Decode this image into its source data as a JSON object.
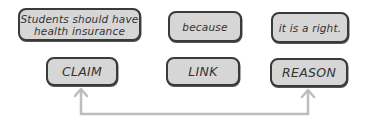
{
  "top_row": {
    "claim_text": "Students should have health insurance",
    "claim_line1": "Students should have",
    "claim_line2": "health insurance",
    "link_text": "because",
    "reason_text": "it is a right."
  },
  "bottom_row": {
    "claim_label": "CLAIM",
    "link_label": "LINK",
    "reason_label": "REASON"
  },
  "colors": {
    "box_fill": "#d6d6d6",
    "box_border": "#3a3a3a",
    "arrow": "#bdbdbd"
  },
  "connector": {
    "from": "REASON",
    "to": "CLAIM",
    "style": "bidirectional-elbow"
  }
}
